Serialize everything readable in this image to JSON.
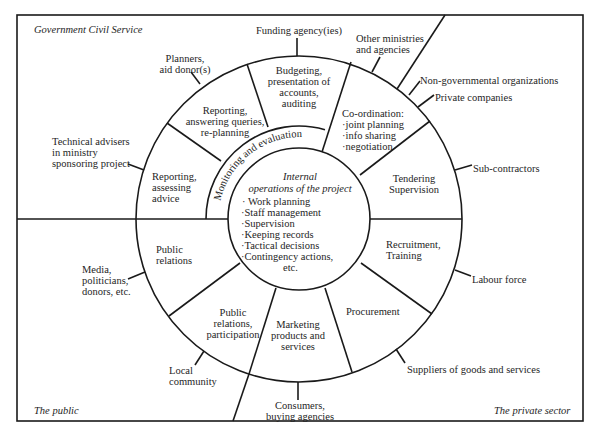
{
  "diagram": {
    "type": "concentric-ring-stakeholder-diagram",
    "sectors": {
      "government": "Government Civil Service",
      "public": "The public",
      "private": "The private sector"
    },
    "core": {
      "title_line1": "Internal",
      "title_line2": "operations of the project",
      "items": [
        "· Work planning",
        "·Staff management",
        "·Supervision",
        "·Keeping records",
        "·Tactical decisions",
        "·Contingency actions,"
      ],
      "items_tail": "etc."
    },
    "monitoring_ring": "Monitoring and evaluation",
    "ring_segments": [
      {
        "id": "reporting-assessing",
        "text": "Reporting,\nassessing\nadvice"
      },
      {
        "id": "reporting-answering",
        "text": "Reporting,\nanswering queries,\nre-planning"
      },
      {
        "id": "budgeting",
        "text": "Budgeting,\npresentation of\naccounts,\nauditing"
      },
      {
        "id": "coordination",
        "text": "Co-ordination:\n·joint planning\n·info sharing\n·negotiation"
      },
      {
        "id": "tendering",
        "text": "Tendering\nSupervision"
      },
      {
        "id": "recruitment",
        "text": "Recruitment,\nTraining"
      },
      {
        "id": "procurement",
        "text": "Procurement"
      },
      {
        "id": "marketing",
        "text": "Marketing\nproducts and\nservices"
      },
      {
        "id": "public-relations-participation",
        "text": "Public\nrelations,\nparticipation"
      },
      {
        "id": "public-relations",
        "text": "Public\nrelations"
      }
    ],
    "external_actors": [
      {
        "id": "technical-advisers",
        "text": "Technical advisers\nin ministry\nsponsoring project"
      },
      {
        "id": "planners",
        "text": "Planners,\naid donor(s)"
      },
      {
        "id": "funding-agency",
        "text": "Funding agency(ies)"
      },
      {
        "id": "other-ministries",
        "text": "Other ministries\nand agencies"
      },
      {
        "id": "ngos",
        "text": "Non-governmental organizations"
      },
      {
        "id": "private-companies",
        "text": "Private companies"
      },
      {
        "id": "sub-contractors",
        "text": "Sub-contractors"
      },
      {
        "id": "labour-force",
        "text": "Labour force"
      },
      {
        "id": "suppliers",
        "text": "Suppliers of goods and services"
      },
      {
        "id": "consumers",
        "text": "Consumers,\nbuying agencies"
      },
      {
        "id": "local-community",
        "text": "Local\ncommunity"
      },
      {
        "id": "media",
        "text": "Media,\npoliticians,\ndonors, etc."
      }
    ],
    "colors": {
      "ink": "#1a1a1a",
      "paper": "#ffffff"
    }
  }
}
